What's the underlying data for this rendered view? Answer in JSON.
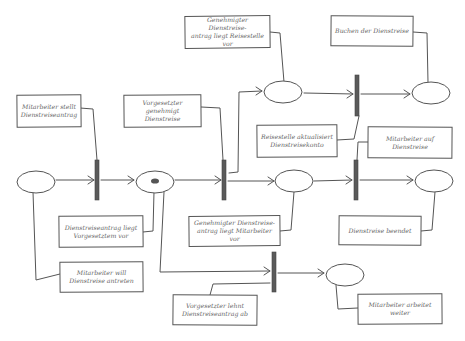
{
  "diagram": {
    "type": "petri-net",
    "colors": {
      "stroke": "#555555",
      "bar_fill": "#5a5a5a",
      "text": "#666666",
      "background": "#ffffff"
    },
    "places": [
      {
        "id": "p1",
        "cx": 36,
        "cy": 182,
        "marked": false
      },
      {
        "id": "p2",
        "cx": 155,
        "cy": 182,
        "marked": true
      },
      {
        "id": "p3",
        "cx": 281,
        "cy": 92,
        "marked": false
      },
      {
        "id": "p4",
        "cx": 294,
        "cy": 182,
        "marked": false
      },
      {
        "id": "p5",
        "cx": 431,
        "cy": 92,
        "marked": false
      },
      {
        "id": "p6",
        "cx": 433,
        "cy": 182,
        "marked": false
      },
      {
        "id": "p7",
        "cx": 345,
        "cy": 275,
        "marked": false
      }
    ],
    "transitions": [
      {
        "id": "t1",
        "x": 97,
        "y": 160,
        "h": 40
      },
      {
        "id": "t2",
        "x": 224,
        "y": 160,
        "h": 40
      },
      {
        "id": "t3",
        "x": 357,
        "y": 75,
        "h": 41
      },
      {
        "id": "t4",
        "x": 356,
        "y": 160,
        "h": 40
      },
      {
        "id": "t5",
        "x": 274,
        "y": 252,
        "h": 40
      }
    ],
    "notes": [
      {
        "id": "n1",
        "label": "Mitarbeiter stellt\nDienstreiseantrag"
      },
      {
        "id": "n2",
        "label": "Vorgesetzter genehmigt\nDienstreise"
      },
      {
        "id": "n3",
        "label": "Genehmigter Dienstreise-\nantrag liegt Reisestelle vor"
      },
      {
        "id": "n4",
        "label": "Buchen der Dienstreise"
      },
      {
        "id": "n5",
        "label": "Reisestelle aktualisiert\nDienstreisekonto"
      },
      {
        "id": "n6",
        "label": "Mitarbeiter auf\nDienstreise"
      },
      {
        "id": "n7",
        "label": "Dienstreiseantrag liegt\nVorgesetztem vor"
      },
      {
        "id": "n8",
        "label": "Genehmigter Dienstreise-\nantrag liegt Mitarbeiter vor"
      },
      {
        "id": "n9",
        "label": "Dienstreise beendet"
      },
      {
        "id": "n10",
        "label": "Mitarbeiter will\nDienstreise antreten"
      },
      {
        "id": "n11",
        "label": "Vorgesetzter lehnt\nDienstreiseantrag ab"
      },
      {
        "id": "n12",
        "label": "Mitarbeiter arbeitet\nweiter"
      }
    ]
  }
}
